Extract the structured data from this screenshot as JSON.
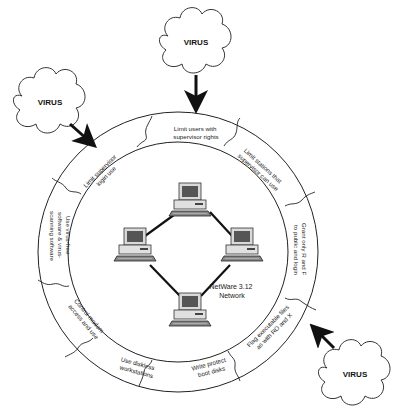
{
  "diagram": {
    "center_label": [
      "NetWare 3.12",
      "Network"
    ],
    "threats": [
      {
        "label": "VIRUS",
        "position": "top"
      },
      {
        "label": "VIRUS",
        "position": "upper-left"
      },
      {
        "label": "VIRUS",
        "position": "lower-right"
      }
    ],
    "ring_segments": [
      {
        "lines": [
          "Limit users with",
          "supervisor rights"
        ]
      },
      {
        "lines": [
          "Limit stations that",
          "supervisor can use"
        ]
      },
      {
        "lines": [
          "Grant only R and F",
          "to public and login"
        ]
      },
      {
        "lines": [
          "Flag executable files",
          "as with RO and X"
        ]
      },
      {
        "lines": [
          "Write protect",
          "boot disks"
        ]
      },
      {
        "lines": [
          "Use diskless",
          "workstations"
        ]
      },
      {
        "lines": [
          "Control modem",
          "access and use"
        ]
      },
      {
        "lines": [
          "Use virus-free",
          "software & virus-",
          "scanning software"
        ]
      },
      {
        "lines": [
          "Limit supervisor",
          "login use"
        ]
      }
    ],
    "network_nodes": [
      "workstation-top",
      "workstation-left",
      "workstation-right",
      "workstation-bottom"
    ],
    "colors": {
      "line": "#111111",
      "computer_body": "#d9d9d9",
      "screen": "#555555"
    }
  }
}
